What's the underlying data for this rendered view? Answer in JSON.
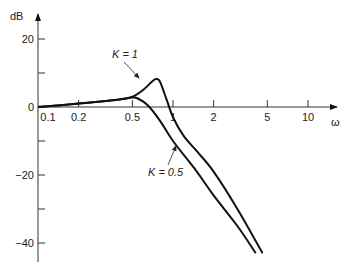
{
  "chart_data": {
    "type": "line",
    "title": "",
    "xlabel": "ω",
    "ylabel": "dB",
    "xscale": "log",
    "xlim": [
      0.1,
      12
    ],
    "ylim": [
      -45,
      25
    ],
    "grid": false,
    "x_ticks": [
      {
        "value": 0.1,
        "label": "0.1"
      },
      {
        "value": 0.2,
        "label": "0.2"
      },
      {
        "value": 0.5,
        "label": "0.5"
      },
      {
        "value": 1,
        "label": "1"
      },
      {
        "value": 2,
        "label": "2"
      },
      {
        "value": 5,
        "label": "5"
      },
      {
        "value": 10,
        "label": "10"
      }
    ],
    "y_ticks": [
      {
        "value": 20,
        "label": "20"
      },
      {
        "value": 10,
        "label": ""
      },
      {
        "value": 0,
        "label": "0"
      },
      {
        "value": -10,
        "label": ""
      },
      {
        "value": -20,
        "label": "−20"
      },
      {
        "value": -30,
        "label": ""
      },
      {
        "value": -40,
        "label": "−40"
      }
    ],
    "series": [
      {
        "name": "K = 1",
        "x": [
          0.1,
          0.2,
          0.4,
          0.5,
          0.6,
          0.7,
          0.75,
          0.8,
          0.9,
          1.0,
          1.2,
          1.5,
          2,
          3,
          4.6
        ],
        "y": [
          0,
          1,
          2.2,
          3,
          5,
          7.5,
          8.2,
          7.5,
          2,
          -3,
          -8.5,
          -13,
          -19,
          -30,
          -43
        ]
      },
      {
        "name": "K = 0.5",
        "x": [
          0.1,
          0.2,
          0.4,
          0.5,
          0.55,
          0.65,
          0.8,
          1.0,
          1.5,
          2,
          3,
          4.1
        ],
        "y": [
          0,
          1,
          2.2,
          2.8,
          2.5,
          0.5,
          -4,
          -10,
          -19,
          -26,
          -35,
          -43
        ]
      }
    ],
    "annotations": [
      {
        "text": "K = 1",
        "points_to_series": "K = 1"
      },
      {
        "text": "K = 0.5",
        "points_to_series": "K = 0.5"
      }
    ]
  }
}
